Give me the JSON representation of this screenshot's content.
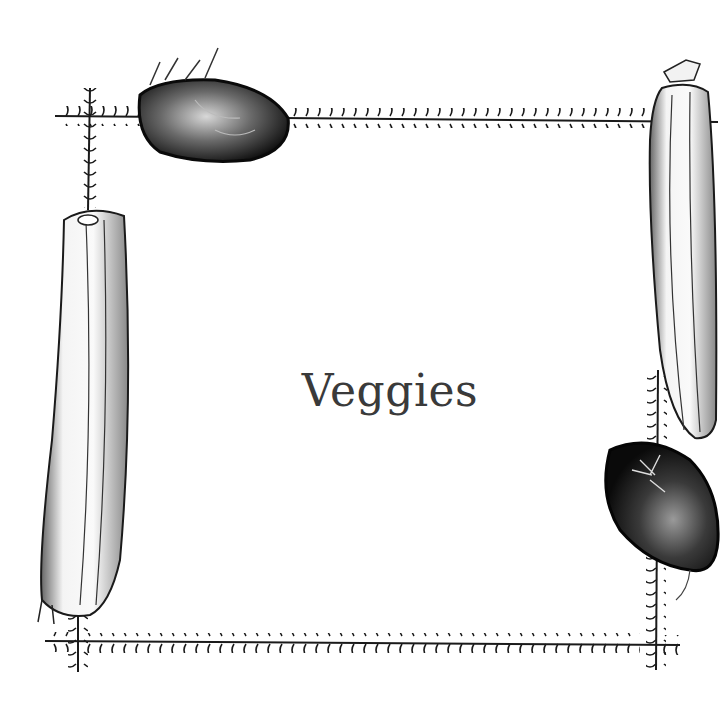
{
  "title": "Veggies",
  "illustration": {
    "style": "pen-and-ink vegetable border",
    "elements": [
      {
        "name": "potato",
        "position": "top-left"
      },
      {
        "name": "zucchini",
        "position": "top-right"
      },
      {
        "name": "zucchini",
        "position": "left"
      },
      {
        "name": "potato",
        "position": "bottom-right"
      }
    ],
    "border": "vine-like frame with tick marks"
  },
  "colors": {
    "ink": "#1a1a1a",
    "title": "#3a3a3a",
    "background": "#ffffff"
  }
}
